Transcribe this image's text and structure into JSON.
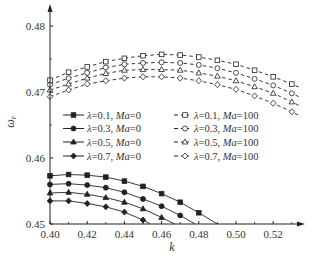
{
  "chart_data": {
    "type": "line",
    "title": "",
    "xlabel": "k",
    "ylabel": "ω_r",
    "xlim": [
      0.4,
      0.535
    ],
    "ylim": [
      0.45,
      0.483
    ],
    "xticks": [
      0.4,
      0.42,
      0.44,
      0.46,
      0.48,
      0.5,
      0.52
    ],
    "xtick_labels": [
      "0.40",
      "0.42",
      "0.44",
      "0.46",
      "0.48",
      "0.50",
      "0.52"
    ],
    "yticks": [
      0.45,
      0.46,
      0.47,
      0.48
    ],
    "ytick_labels": [
      "0.45",
      "0.46",
      "0.47",
      "0.48"
    ],
    "grid": false,
    "legend_position": "center-left, two columns",
    "series": [
      {
        "name": "λ=0.1, Ma=0",
        "lambda": "0.1",
        "ma": "0",
        "marker": "square",
        "filled": true,
        "style": "solid",
        "x": [
          0.4,
          0.41,
          0.42,
          0.43,
          0.44,
          0.45,
          0.46,
          0.47,
          0.48,
          0.49
        ],
        "values": [
          0.4573,
          0.4575,
          0.4574,
          0.4571,
          0.4565,
          0.4557,
          0.4546,
          0.4533,
          0.4517,
          0.45
        ],
        "marker_count": 9
      },
      {
        "name": "λ=0.3, Ma=0",
        "lambda": "0.3",
        "ma": "0",
        "marker": "circle",
        "filled": true,
        "style": "solid",
        "x": [
          0.4,
          0.41,
          0.42,
          0.43,
          0.44,
          0.45,
          0.46,
          0.47,
          0.478
        ],
        "values": [
          0.456,
          0.4561,
          0.4559,
          0.4555,
          0.4548,
          0.4538,
          0.4527,
          0.4513,
          0.45
        ],
        "marker_count": 8
      },
      {
        "name": "λ=0.5, Ma=0",
        "lambda": "0.5",
        "ma": "0",
        "marker": "triangle",
        "filled": true,
        "style": "solid",
        "x": [
          0.4,
          0.41,
          0.42,
          0.43,
          0.44,
          0.45,
          0.46,
          0.467
        ],
        "values": [
          0.4547,
          0.4548,
          0.4545,
          0.454,
          0.4533,
          0.4523,
          0.451,
          0.45
        ],
        "marker_count": 7
      },
      {
        "name": "λ=0.7, Ma=0",
        "lambda": "0.7",
        "ma": "0",
        "marker": "diamond",
        "filled": true,
        "style": "solid",
        "x": [
          0.4,
          0.41,
          0.42,
          0.43,
          0.44,
          0.45,
          0.454
        ],
        "values": [
          0.4535,
          0.4535,
          0.4531,
          0.4526,
          0.4518,
          0.4506,
          0.45
        ],
        "marker_count": 6
      },
      {
        "name": "λ=0.1, Ma=100",
        "lambda": "0.1",
        "ma": "100",
        "marker": "square",
        "filled": false,
        "style": "dashed",
        "x": [
          0.4,
          0.41,
          0.42,
          0.43,
          0.44,
          0.45,
          0.46,
          0.47,
          0.48,
          0.49,
          0.5,
          0.51,
          0.52,
          0.53,
          0.535
        ],
        "values": [
          0.4718,
          0.473,
          0.4738,
          0.4746,
          0.4751,
          0.4755,
          0.4757,
          0.4756,
          0.4753,
          0.4748,
          0.4742,
          0.4733,
          0.4723,
          0.4712,
          0.4706
        ],
        "marker_count": 14
      },
      {
        "name": "λ=0.3, Ma=100",
        "lambda": "0.3",
        "ma": "100",
        "marker": "circle",
        "filled": false,
        "style": "dashed",
        "x": [
          0.4,
          0.41,
          0.42,
          0.43,
          0.44,
          0.45,
          0.46,
          0.47,
          0.48,
          0.49,
          0.5,
          0.51,
          0.52,
          0.53,
          0.535
        ],
        "values": [
          0.4711,
          0.4721,
          0.4729,
          0.4737,
          0.4742,
          0.4744,
          0.4745,
          0.4744,
          0.4741,
          0.4736,
          0.4729,
          0.472,
          0.471,
          0.4698,
          0.4691
        ],
        "marker_count": 14
      },
      {
        "name": "λ=0.5, Ma=100",
        "lambda": "0.5",
        "ma": "100",
        "marker": "triangle",
        "filled": false,
        "style": "dashed",
        "x": [
          0.4,
          0.41,
          0.42,
          0.43,
          0.44,
          0.45,
          0.46,
          0.47,
          0.48,
          0.49,
          0.5,
          0.51,
          0.52,
          0.53,
          0.535
        ],
        "values": [
          0.4703,
          0.4712,
          0.4721,
          0.4728,
          0.4733,
          0.4734,
          0.4734,
          0.4733,
          0.4729,
          0.4724,
          0.4717,
          0.4708,
          0.4698,
          0.4685,
          0.4678
        ],
        "marker_count": 14
      },
      {
        "name": "λ=0.7, Ma=100",
        "lambda": "0.7",
        "ma": "100",
        "marker": "diamond",
        "filled": false,
        "style": "dashed",
        "x": [
          0.4,
          0.41,
          0.42,
          0.43,
          0.44,
          0.45,
          0.46,
          0.47,
          0.48,
          0.49,
          0.5,
          0.51,
          0.52,
          0.53,
          0.535
        ],
        "values": [
          0.4693,
          0.4703,
          0.4712,
          0.4717,
          0.4721,
          0.4723,
          0.4723,
          0.4721,
          0.4717,
          0.4711,
          0.4704,
          0.4694,
          0.4683,
          0.467,
          0.4663
        ],
        "marker_count": 14
      }
    ]
  },
  "legend": {
    "left": [
      {
        "symbol": "λ",
        "eq": "=0.1, ",
        "ma_label": "Ma",
        "ma_eq": "=0"
      },
      {
        "symbol": "λ",
        "eq": "=0.3, ",
        "ma_label": "Ma",
        "ma_eq": "=0"
      },
      {
        "symbol": "λ",
        "eq": "=0.5, ",
        "ma_label": "Ma",
        "ma_eq": "=0"
      },
      {
        "symbol": "λ",
        "eq": "=0.7, ",
        "ma_label": "Ma",
        "ma_eq": "=0"
      }
    ],
    "right": [
      {
        "symbol": "λ",
        "eq": "=0.1, ",
        "ma_label": "Ma",
        "ma_eq": "=100"
      },
      {
        "symbol": "λ",
        "eq": "=0.3, ",
        "ma_label": "Ma",
        "ma_eq": "=100"
      },
      {
        "symbol": "λ",
        "eq": "=0.5, ",
        "ma_label": "Ma",
        "ma_eq": "=100"
      },
      {
        "symbol": "λ",
        "eq": "=0.7, ",
        "ma_label": "Ma",
        "ma_eq": "=100"
      }
    ]
  },
  "axes": {
    "x_title": "k",
    "y_title_main": "ω",
    "y_title_sub": "r"
  },
  "colors": {
    "line": "#222222",
    "text": "#333333",
    "background": "#ffffff"
  }
}
